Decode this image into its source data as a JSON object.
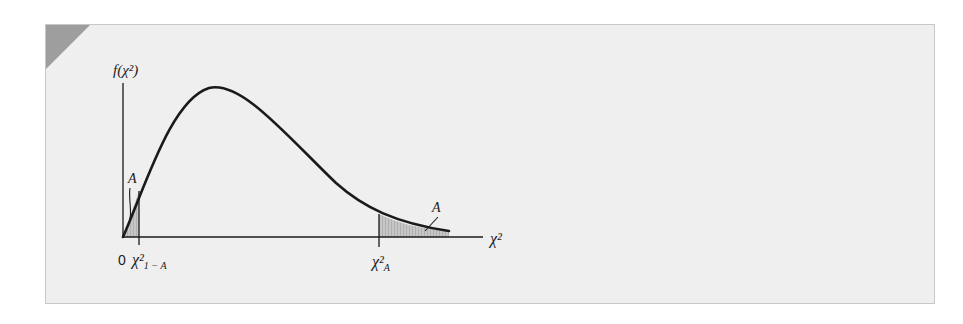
{
  "figure": {
    "type": "diagram",
    "y_axis_label": "f(χ²)",
    "x_axis_label": "χ²",
    "origin_label": "0",
    "curve_shape": "right-skewed chi-squared density, rising from origin, peaking early, decaying with long right tail",
    "regions": [
      {
        "name": "lower-tail",
        "boundary_label": "χ²",
        "boundary_subscript": "1 − A",
        "area_label": "A",
        "description": "shaded area between 0 and the lower critical value"
      },
      {
        "name": "upper-tail",
        "boundary_label": "χ²",
        "boundary_subscript": "A",
        "area_label": "A",
        "description": "shaded area to the right of the upper critical value"
      }
    ]
  },
  "colors": {
    "panel_background": "#efefef",
    "panel_border": "#c8c8c8",
    "corner_accent": "#9e9e9e",
    "curve": "#1a1a1a",
    "shade_fill": "#b9b9b9"
  }
}
